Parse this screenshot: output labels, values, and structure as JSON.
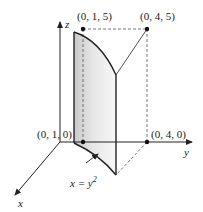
{
  "diagram": {
    "axes": {
      "x_label": "x",
      "y_label": "y",
      "z_label": "z"
    },
    "points": {
      "p015": "(0, 1, 5)",
      "p045": "(0, 4, 5)",
      "p010": "(0, 1, 0)",
      "p040": "(0, 4, 0)"
    },
    "curve_label": "x = y",
    "curve_label_exp": "2",
    "colors": {
      "line": "#222222",
      "dashed": "#555555",
      "surface_light": "#f2f2f2",
      "surface_dark": "#c8c8c8"
    }
  }
}
